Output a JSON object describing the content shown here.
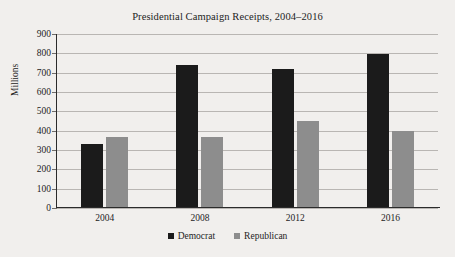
{
  "chart_data": {
    "type": "bar",
    "title": "Presidential Campaign Receipts, 2004–2016",
    "xlabel": "",
    "ylabel": "Millions",
    "categories": [
      "2004",
      "2008",
      "2012",
      "2016"
    ],
    "series": [
      {
        "name": "Democrat",
        "color": "#1b1b1b",
        "values": [
          330,
          740,
          720,
          795
        ]
      },
      {
        "name": "Republican",
        "color": "#8d8d8d",
        "values": [
          365,
          365,
          450,
          400
        ]
      }
    ],
    "ylim": [
      0,
      900
    ],
    "ytick_step": 100,
    "yticks": [
      900,
      800,
      700,
      600,
      500,
      400,
      300,
      200,
      100,
      0
    ],
    "ytick_labels": [
      "900",
      "800",
      "700",
      "600",
      "500",
      "400",
      "300",
      "200",
      "100",
      "0"
    ],
    "grid": true,
    "grid_axis": "y",
    "legend_position": "bottom-center",
    "background_color": "#f1efed",
    "gridline_color": "#b9b6b3",
    "axis_color": "#2b2b2b",
    "text_color": "#1d1d1d"
  }
}
